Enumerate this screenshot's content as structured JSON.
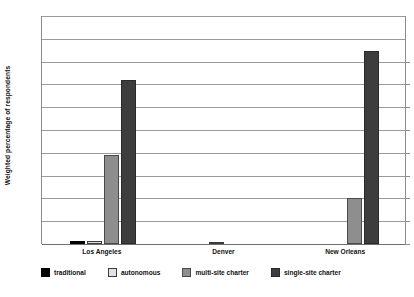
{
  "chart_data": {
    "type": "bar",
    "title": "",
    "subtitle": "",
    "xlabel": "",
    "ylabel": "Weighted percentage of respondents",
    "ylim": [
      0,
      100
    ],
    "ytick_labels": [
      "100%",
      "90%",
      "80%",
      "70%",
      "60%",
      "50%",
      "40%",
      "30%",
      "20%",
      "10%",
      "0%"
    ],
    "ytick_values": [
      100,
      90,
      80,
      70,
      60,
      50,
      40,
      30,
      20,
      10,
      0
    ],
    "grid": true,
    "legend_position": "bottom",
    "categories": [
      "Los Angeles",
      "Denver",
      "New Orleans"
    ],
    "series": [
      {
        "name": "traditional",
        "color": "#000000",
        "values": [
          1.5,
          0.0,
          0.0
        ]
      },
      {
        "name": "autonomous",
        "color": "#e2e2e2",
        "values": [
          1.5,
          0.3,
          0.0
        ]
      },
      {
        "name": "multi-site charter",
        "color": "#8e8e8e",
        "values": [
          39.0,
          0.0,
          20.0
        ]
      },
      {
        "name": "single-site charter",
        "color": "#3d3d3d",
        "values": [
          72.0,
          0.0,
          84.5
        ]
      }
    ]
  },
  "axis": {
    "y_title": "Weighted percentage of respondents"
  },
  "legend": {
    "items": [
      {
        "label": "traditional"
      },
      {
        "label": "autonomous"
      },
      {
        "label": "multi-site charter"
      },
      {
        "label": "single-site charter"
      }
    ]
  }
}
